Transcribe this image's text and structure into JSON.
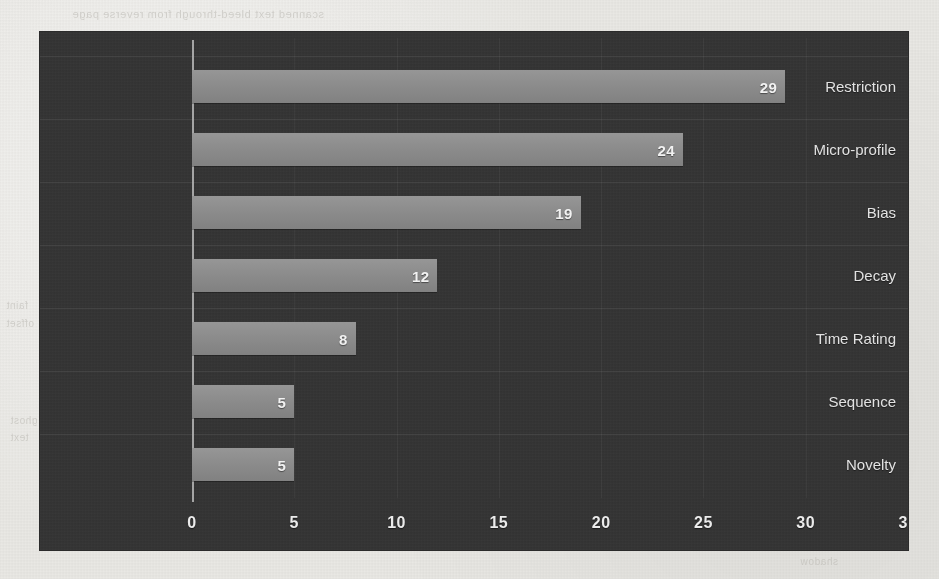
{
  "page": {
    "background_color": "#e9e8e4",
    "bleed_through_text": {
      "top": "scanned text bleed-through from reverse page",
      "mid_left_1": "faint",
      "mid_left_2": "offset",
      "low_left_1": "ghost",
      "low_left_2": "text",
      "bottom_right": "shadow"
    }
  },
  "chart": {
    "panel_color": "#343434",
    "bar_color": "#8b8b8b",
    "axis_color": "#b9b9b9",
    "label_color": "#e2e2e2",
    "value_label_color": "#f2f2f2"
  },
  "chart_data": {
    "type": "bar",
    "orientation": "horizontal",
    "title": "",
    "subtitle": "",
    "xlabel": "",
    "ylabel": "",
    "categories": [
      "Restriction",
      "Micro-profile",
      "Bias",
      "Decay",
      "Time Rating",
      "Sequence",
      "Novelty"
    ],
    "values": [
      29,
      24,
      19,
      12,
      8,
      5,
      5
    ],
    "value_labels": [
      "29",
      "24",
      "19",
      "12",
      "8",
      "5",
      "5"
    ],
    "xlim": [
      0,
      35
    ],
    "xticks": [
      0,
      5,
      10,
      15,
      20,
      25,
      30,
      35
    ],
    "xtick_labels": [
      "0",
      "5",
      "10",
      "15",
      "20",
      "25",
      "30",
      "35"
    ],
    "grid": true,
    "legend": false,
    "legend_position": "none"
  }
}
